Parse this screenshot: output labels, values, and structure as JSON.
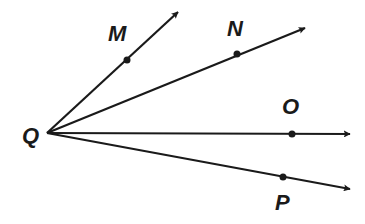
{
  "diagram": {
    "type": "rays-from-common-vertex",
    "stroke_color": "#1a1a1a",
    "background": "#ffffff",
    "vertex": {
      "label": "Q",
      "x": 47,
      "y": 133,
      "label_x": 22,
      "label_y": 143
    },
    "rays": [
      {
        "id": "QM",
        "point_label": "M",
        "point": [
          127,
          60
        ],
        "tip": [
          178,
          12
        ],
        "label_x": 108,
        "label_y": 41
      },
      {
        "id": "QN",
        "point_label": "N",
        "point": [
          237,
          54
        ],
        "tip": [
          305,
          28
        ],
        "label_x": 227,
        "label_y": 36
      },
      {
        "id": "QO",
        "point_label": "O",
        "point": [
          292,
          134
        ],
        "tip": [
          350,
          134
        ],
        "label_x": 282,
        "label_y": 114
      },
      {
        "id": "QP",
        "point_label": "P",
        "point": [
          283,
          177
        ],
        "tip": [
          350,
          189
        ],
        "label_x": 275,
        "label_y": 210
      }
    ]
  }
}
